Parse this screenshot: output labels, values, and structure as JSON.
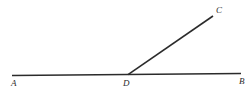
{
  "figure": {
    "background_color": "#ffffff",
    "stroke_color": "#2b2b2b",
    "label_color": "#2b2b2b",
    "width": 252,
    "height": 98
  },
  "labels": {
    "a": "A",
    "b": "B",
    "c": "C",
    "d": "D"
  },
  "geometry": {
    "type": "line-and-ray",
    "points": {
      "A": {
        "x": 12,
        "y": 75.5
      },
      "B": {
        "x": 241,
        "y": 73.5
      },
      "C": {
        "x": 213,
        "y": 16
      },
      "D": {
        "x": 128,
        "y": 74.7
      }
    },
    "segments": [
      {
        "name": "line-AB",
        "from": "A",
        "to": "B",
        "stroke_width": 1.6
      },
      {
        "name": "ray-DC",
        "from": "D",
        "to": "C",
        "stroke_width": 1.6
      }
    ]
  }
}
